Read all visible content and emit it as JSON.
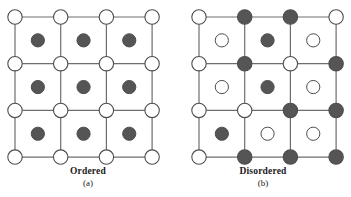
{
  "figure": {
    "width": 351,
    "height": 197,
    "background_color": "#ffffff"
  },
  "style": {
    "node_fill_open": "#ffffff",
    "node_fill_filled": "#555555",
    "node_stroke": "#4d4d4d",
    "interstitial_fill_open": "#ffffff",
    "interstitial_fill_filled": "#555555",
    "interstitial_stroke": "#4d4d4d",
    "bond_color": "#6e6e6e",
    "text_color": "#1a1a1a",
    "node_radius": 7.2,
    "interstitial_radius": 6.6,
    "bond_width": 1.2,
    "node_stroke_width": 1.1,
    "interstitial_stroke_width": 1.0
  },
  "lattice": {
    "columns": 4,
    "rows": 4,
    "cells_x": 3,
    "cells_y": 3,
    "origin_x": 15,
    "origin_y": 17,
    "spacing_x": 45.7,
    "spacing_y": 46.7
  },
  "panels": [
    {
      "id": "a",
      "caption_title": "Ordered",
      "caption_letter": "(a)",
      "origin_x": 15,
      "nodes": [
        [
          "open",
          "open",
          "open",
          "open"
        ],
        [
          "open",
          "open",
          "open",
          "open"
        ],
        [
          "open",
          "open",
          "open",
          "open"
        ],
        [
          "open",
          "open",
          "open",
          "open"
        ]
      ],
      "interstitials": [
        [
          "filled",
          "filled",
          "filled"
        ],
        [
          "filled",
          "filled",
          "filled"
        ],
        [
          "filled",
          "filled",
          "filled"
        ]
      ]
    },
    {
      "id": "b",
      "caption_title": "Disordered",
      "caption_letter": "(b)",
      "origin_x": 24,
      "nodes": [
        [
          "open",
          "filled",
          "filled",
          "open"
        ],
        [
          "open",
          "filled",
          "open",
          "filled"
        ],
        [
          "open",
          "open",
          "filled",
          "filled"
        ],
        [
          "open",
          "filled",
          "filled",
          "filled"
        ]
      ],
      "interstitials": [
        [
          "open",
          "filled",
          "open"
        ],
        [
          "open",
          "filled",
          "open"
        ],
        [
          "filled",
          "open",
          "open"
        ]
      ]
    }
  ]
}
